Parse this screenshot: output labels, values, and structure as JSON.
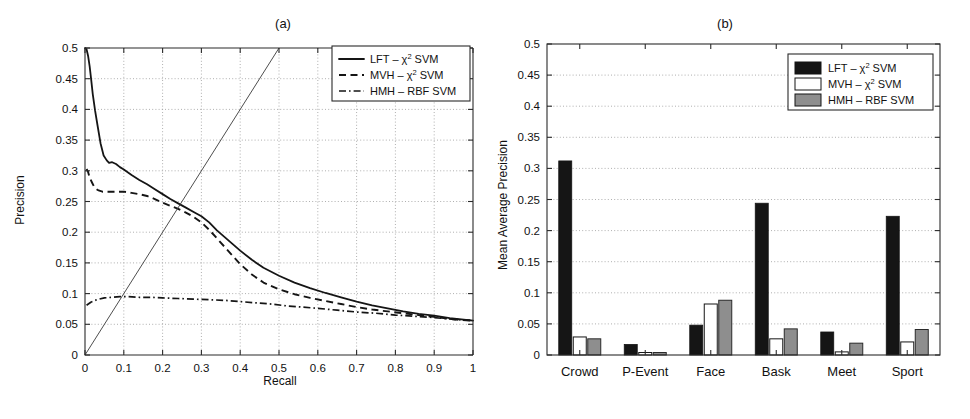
{
  "figure": {
    "background": "#ffffff",
    "ink_color": "#151515",
    "grid_color": "#9a9a9a"
  },
  "panels": [
    {
      "id": "a",
      "title": "(a)",
      "chart_index": 0
    },
    {
      "id": "b",
      "title": "(b)",
      "chart_index": 1
    }
  ],
  "chart_data": [
    {
      "type": "line",
      "title": "(a)",
      "xlabel": "Recall",
      "ylabel": "Precision",
      "xlim": [
        0,
        1
      ],
      "ylim": [
        0,
        0.5
      ],
      "grid": true,
      "legend_position": "top-right",
      "xticks": [
        "0",
        "0.1",
        "0.2",
        "0.3",
        "0.4",
        "0.5",
        "0.6",
        "0.7",
        "0.8",
        "0.9",
        "1"
      ],
      "xtick_values": [
        0,
        0.1,
        0.2,
        0.3,
        0.4,
        0.5,
        0.6,
        0.7,
        0.8,
        0.9,
        1
      ],
      "yticks": [
        "0",
        "0.05",
        "0.1",
        "0.15",
        "0.2",
        "0.25",
        "0.3",
        "0.35",
        "0.4",
        "0.45",
        "0.5"
      ],
      "ytick_values": [
        0,
        0.05,
        0.1,
        0.15,
        0.2,
        0.25,
        0.3,
        0.35,
        0.4,
        0.45,
        0.5
      ],
      "series": [
        {
          "name": "LFT - chi^2 SVM",
          "legend_label_parts": {
            "prefix": "LFT ",
            "dash": "– ",
            "chi": "χ",
            "sup": "2",
            "suffix": " SVM"
          },
          "style": "solid",
          "x": [
            0.0,
            0.004,
            0.008,
            0.012,
            0.016,
            0.02,
            0.026,
            0.032,
            0.04,
            0.048,
            0.056,
            0.062,
            0.07,
            0.08,
            0.09,
            0.1,
            0.12,
            0.14,
            0.16,
            0.18,
            0.2,
            0.22,
            0.24,
            0.26,
            0.28,
            0.3,
            0.32,
            0.34,
            0.36,
            0.38,
            0.4,
            0.43,
            0.46,
            0.5,
            0.54,
            0.58,
            0.62,
            0.66,
            0.7,
            0.74,
            0.78,
            0.82,
            0.86,
            0.9,
            0.94,
            0.97,
            1.0
          ],
          "y": [
            0.5,
            0.498,
            0.487,
            0.47,
            0.448,
            0.425,
            0.398,
            0.375,
            0.345,
            0.325,
            0.317,
            0.313,
            0.314,
            0.311,
            0.306,
            0.302,
            0.293,
            0.285,
            0.278,
            0.27,
            0.262,
            0.254,
            0.247,
            0.24,
            0.233,
            0.226,
            0.216,
            0.203,
            0.192,
            0.181,
            0.17,
            0.155,
            0.142,
            0.129,
            0.118,
            0.109,
            0.101,
            0.094,
            0.087,
            0.081,
            0.076,
            0.071,
            0.067,
            0.064,
            0.06,
            0.058,
            0.056
          ]
        },
        {
          "name": "MVH - chi^2 SVM",
          "legend_label_parts": {
            "prefix": "MVH ",
            "dash": "– ",
            "chi": "χ",
            "sup": "2",
            "suffix": " SVM"
          },
          "style": "dashed",
          "x": [
            0.004,
            0.008,
            0.012,
            0.018,
            0.025,
            0.035,
            0.045,
            0.06,
            0.08,
            0.1,
            0.12,
            0.14,
            0.16,
            0.18,
            0.2,
            0.22,
            0.24,
            0.26,
            0.28,
            0.3,
            0.32,
            0.34,
            0.36,
            0.38,
            0.4,
            0.43,
            0.46,
            0.5,
            0.54,
            0.58,
            0.62,
            0.66,
            0.7,
            0.74,
            0.78,
            0.82,
            0.86,
            0.9,
            0.94,
            0.97,
            1.0
          ],
          "y": [
            0.303,
            0.298,
            0.289,
            0.281,
            0.272,
            0.268,
            0.266,
            0.266,
            0.266,
            0.266,
            0.264,
            0.262,
            0.259,
            0.254,
            0.248,
            0.243,
            0.238,
            0.232,
            0.225,
            0.216,
            0.204,
            0.19,
            0.176,
            0.162,
            0.148,
            0.131,
            0.118,
            0.107,
            0.099,
            0.093,
            0.088,
            0.083,
            0.078,
            0.074,
            0.071,
            0.068,
            0.065,
            0.062,
            0.059,
            0.057,
            0.056
          ]
        },
        {
          "name": "HMH - RBF SVM",
          "legend_label_parts": {
            "prefix": "HMH ",
            "dash": "– ",
            "chi": "",
            "sup": "",
            "suffix": "RBF SVM"
          },
          "style": "dashdot",
          "x": [
            0.004,
            0.015,
            0.03,
            0.05,
            0.07,
            0.09,
            0.11,
            0.14,
            0.17,
            0.2,
            0.24,
            0.28,
            0.32,
            0.36,
            0.4,
            0.44,
            0.48,
            0.52,
            0.56,
            0.6,
            0.65,
            0.7,
            0.75,
            0.8,
            0.85,
            0.9,
            0.95,
            1.0
          ],
          "y": [
            0.081,
            0.086,
            0.09,
            0.093,
            0.094,
            0.095,
            0.095,
            0.094,
            0.094,
            0.093,
            0.092,
            0.091,
            0.09,
            0.089,
            0.087,
            0.085,
            0.083,
            0.08,
            0.078,
            0.076,
            0.073,
            0.07,
            0.068,
            0.065,
            0.063,
            0.061,
            0.058,
            0.056
          ]
        },
        {
          "name": "diagonal reference",
          "style": "thin-solid",
          "x": [
            0.0,
            0.5
          ],
          "y": [
            0.0,
            0.5
          ]
        }
      ]
    },
    {
      "type": "bar",
      "title": "(b)",
      "xlabel": "",
      "ylabel": "Mean Average Precision",
      "ylim": [
        0,
        0.5
      ],
      "grid": true,
      "legend_position": "top-right",
      "categories": [
        "Crowd",
        "P-Event",
        "Face",
        "Bask",
        "Meet",
        "Sport"
      ],
      "yticks": [
        "0",
        "0.05",
        "0.1",
        "0.15",
        "0.2",
        "0.25",
        "0.3",
        "0.35",
        "0.4",
        "0.45",
        "0.5"
      ],
      "ytick_values": [
        0,
        0.05,
        0.1,
        0.15,
        0.2,
        0.25,
        0.3,
        0.35,
        0.4,
        0.45,
        0.5
      ],
      "series": [
        {
          "name": "LFT - chi^2 SVM",
          "legend_label_parts": {
            "prefix": "LFT ",
            "dash": "– ",
            "chi": "χ",
            "sup": "2",
            "suffix": " SVM"
          },
          "swatch": "#151515",
          "values": [
            0.312,
            0.017,
            0.048,
            0.244,
            0.037,
            0.223
          ]
        },
        {
          "name": "MVH - chi^2 SVM",
          "legend_label_parts": {
            "prefix": "MVH ",
            "dash": "– ",
            "chi": "χ",
            "sup": "2",
            "suffix": " SVM"
          },
          "swatch": "#ffffff",
          "values": [
            0.029,
            0.004,
            0.082,
            0.026,
            0.005,
            0.021
          ]
        },
        {
          "name": "HMH - RBF SVM",
          "legend_label_parts": {
            "prefix": "HMH ",
            "dash": "– ",
            "chi": "",
            "sup": "",
            "suffix": "RBF SVM"
          },
          "swatch": "#8e8e8e",
          "values": [
            0.026,
            0.004,
            0.088,
            0.042,
            0.019,
            0.041
          ]
        }
      ]
    }
  ]
}
